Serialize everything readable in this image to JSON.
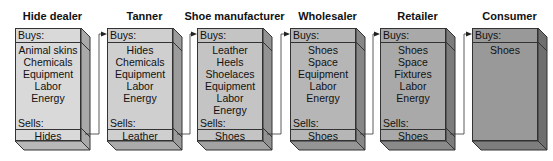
{
  "diagram": {
    "type": "value-chain flow",
    "stages": [
      {
        "name": "Hide dealer",
        "buys_label": "Buys:",
        "buys": [
          "Animal skins",
          "Chemicals",
          "Equipment",
          "Labor",
          "Energy"
        ],
        "sells_label": "Sells:",
        "sells": "Hides",
        "fill": "#d9d9d9",
        "side": "#a9a9a9",
        "bottom": "#b8b8b8"
      },
      {
        "name": "Tanner",
        "buys_label": "Buys:",
        "buys": [
          "Hides",
          "Chemicals",
          "Equipment",
          "Labor",
          "Energy"
        ],
        "sells_label": "Sells:",
        "sells": "Leather",
        "fill": "#cfcfcf",
        "side": "#9c9c9c",
        "bottom": "#ababab"
      },
      {
        "name": "Shoe manufacturer",
        "buys_label": "Buys:",
        "buys": [
          "Leather",
          "Heels",
          "Shoelaces",
          "Equipment",
          "Labor",
          "Energy"
        ],
        "sells_label": "Sells:",
        "sells": "Shoes",
        "fill": "#c4c4c4",
        "side": "#939393",
        "bottom": "#a2a2a2"
      },
      {
        "name": "Wholesaler",
        "buys_label": "Buys:",
        "buys": [
          "Shoes",
          "Space",
          "Equipment",
          "Labor",
          "Energy"
        ],
        "sells_label": "Sells:",
        "sells": "Shoes",
        "fill": "#b6b6b6",
        "side": "#878787",
        "bottom": "#959595"
      },
      {
        "name": "Retailer",
        "buys_label": "Buys:",
        "buys": [
          "Shoes",
          "Space",
          "Fixtures",
          "Labor",
          "Energy"
        ],
        "sells_label": "Sells:",
        "sells": "Shoes",
        "fill": "#a9a9a9",
        "side": "#7c7c7c",
        "bottom": "#8a8a8a"
      },
      {
        "name": "Consumer",
        "buys_label": "Buys:",
        "buys": [
          "Shoes"
        ],
        "sells_label": "",
        "sells": "",
        "fill": "#999999",
        "side": "#6f6f6f",
        "bottom": "#7e7e7e"
      }
    ]
  }
}
